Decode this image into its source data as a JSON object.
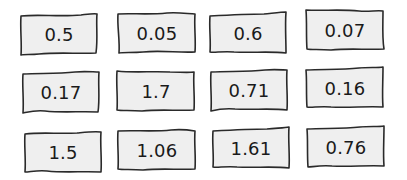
{
  "cards": [
    {
      "value": "0.5"
    },
    {
      "value": "0.05"
    },
    {
      "value": "0.6"
    },
    {
      "value": "0.07"
    },
    {
      "value": "0.17"
    },
    {
      "value": "1.7"
    },
    {
      "value": "0.71"
    },
    {
      "value": "0.16"
    },
    {
      "value": "1.5"
    },
    {
      "value": "1.06"
    },
    {
      "value": "1.61"
    },
    {
      "value": "0.76"
    }
  ],
  "colors": {
    "card_fill": "#efefef",
    "card_stroke": "#2a2a2a",
    "text": "#1a1a1a",
    "background": "#ffffff"
  }
}
